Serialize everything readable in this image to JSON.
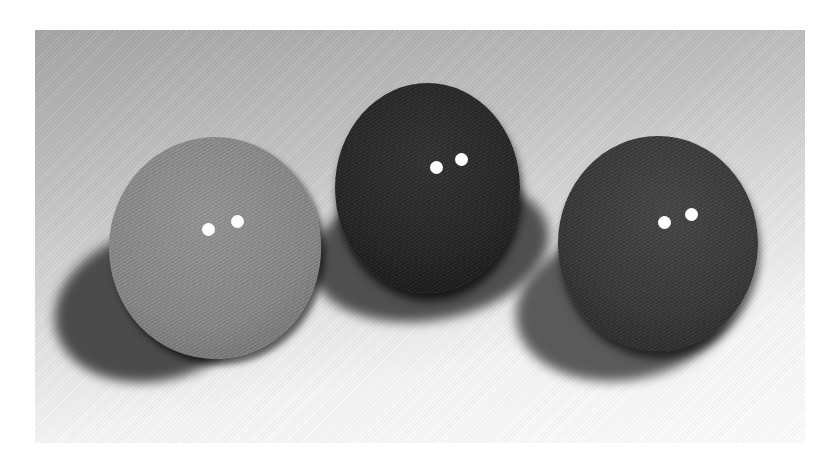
{
  "image": {
    "description": "Three squash balls on a white textured cloth, grayscale photograph",
    "background_color": "#ffffff",
    "balls": [
      {
        "position": "left",
        "tone": "light-gray",
        "color": "#8e8e8e",
        "dots": 2
      },
      {
        "position": "center",
        "tone": "black",
        "color": "#2a2a2a",
        "dots": 2
      },
      {
        "position": "right",
        "tone": "dark-gray",
        "color": "#3a3a3a",
        "dots": 2
      }
    ]
  }
}
